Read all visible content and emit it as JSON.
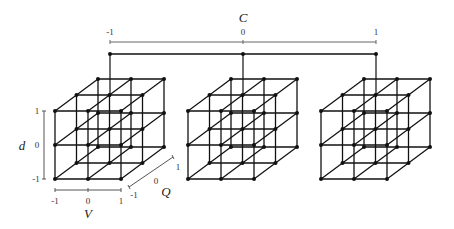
{
  "axes": {
    "C": {
      "label": "C",
      "ticks": [
        "-1",
        "0",
        "1"
      ]
    },
    "d": {
      "label": "d",
      "ticks": [
        "1",
        "0",
        "-1"
      ]
    },
    "V": {
      "label": "V",
      "ticks": [
        "-1",
        "0",
        "1"
      ]
    },
    "Q": {
      "label": "Q",
      "ticks": [
        "-1",
        "0",
        "1"
      ]
    }
  },
  "cubes": [
    {
      "C": "-1",
      "grid": "3x3x3"
    },
    {
      "C": "0",
      "grid": "3x3x3"
    },
    {
      "C": "1",
      "grid": "3x3x3"
    }
  ],
  "colors": {
    "line": "#111111",
    "axis": "#555555"
  }
}
